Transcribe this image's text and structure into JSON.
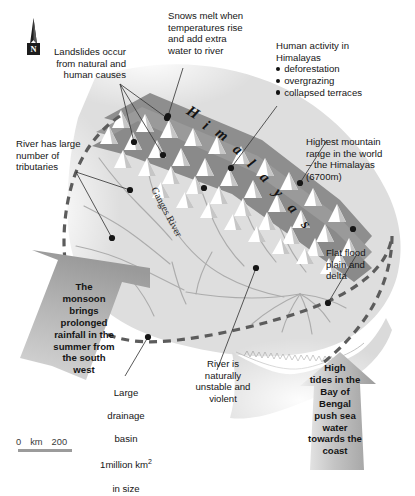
{
  "map": {
    "title_region": "Ganges basin hazard map",
    "north_arrow_label": "N",
    "river_label": "Ganges River",
    "mountain_range_label": "Himalayas",
    "mountain_range_letters": [
      "H",
      "i",
      "m",
      "a",
      "l",
      "a",
      "y",
      "a",
      "s"
    ],
    "colors": {
      "land": "#dcdcdc",
      "land_dark": "#c9c9c9",
      "mountain_band": "#8e8e8e",
      "mountain_peak": "#ffffff",
      "boundary_dash": "#5c5c5c",
      "arrow_fill": "#b5b5b5",
      "river_line": "#a8a8a8",
      "text": "#161616",
      "scale_bar": "#9b9b9b"
    }
  },
  "scale": {
    "min": "0",
    "unit": "km",
    "max": "200"
  },
  "annotations": {
    "landslides": "Landslides occur\nfrom natural and\nhuman causes",
    "snows": "Snows melt when\ntemperatures rise\nand add extra\nwater to river",
    "human_activity_title": "Human activity in\nHimalayas",
    "human_activity_items": [
      "deforestation",
      "overgrazing",
      "collapsed terraces"
    ],
    "tributaries": "River has large\nnumber of\ntributaries",
    "highest_range": "Highest mountain\nrange in the world\n– the Himalayas\n(6700m)",
    "flat_flood": "Flat flood\nplain and\ndelta",
    "large_basin_line1": "Large",
    "large_basin_line2": "drainage",
    "large_basin_line3": "basin",
    "large_basin_line4_pre": "1million km",
    "large_basin_line4_sup": "2",
    "large_basin_line5": "in size",
    "river_unstable": "River is\nnaturally\nunstable and\nviolent",
    "monsoon_arrow": "The\nmonsoon\nbrings\nprolonged\nrainfall in the\nsummer from\nthe south\nwest",
    "tides_arrow": "High\ntides in the\nBay of\nBengal\npush sea\nwater\ntowards the\ncoast"
  }
}
